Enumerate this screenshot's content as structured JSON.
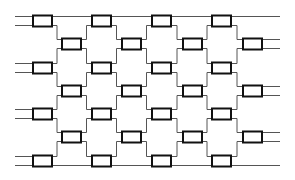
{
  "diagram": {
    "type": "brickwork-network",
    "width": 295,
    "height": 180,
    "colors": {
      "wire": "#555555",
      "box_stroke": "#111111",
      "box_fill": "#ffffff"
    },
    "box": {
      "w": 19,
      "h": 11,
      "wire_offset": 4.5
    },
    "wire_x_start": 15,
    "wire_x_end": 280,
    "columns_x": [
      33,
      62,
      92,
      122,
      152,
      183,
      212,
      243
    ],
    "odd_rows_y": [
      21,
      68,
      114,
      161
    ],
    "even_rows_y": [
      44,
      91,
      137
    ]
  }
}
